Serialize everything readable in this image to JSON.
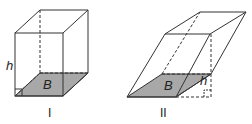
{
  "figures": [
    {
      "id": "I",
      "label": "I",
      "base_label": "B",
      "height_label": "h",
      "type": "right rectangular prism"
    },
    {
      "id": "II",
      "label": "II",
      "base_label": "B",
      "height_label": "h",
      "type": "oblique prism"
    }
  ],
  "colors": {
    "stroke": "#333333",
    "base_fill": "#a8a8a8",
    "background": "#ffffff"
  }
}
